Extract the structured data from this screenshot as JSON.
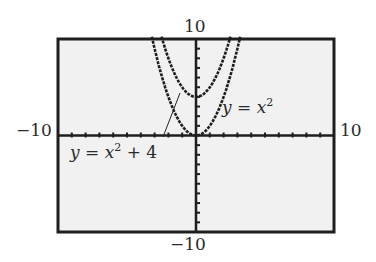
{
  "chart_data": {
    "type": "line",
    "title": "",
    "xlabel": "",
    "ylabel": "",
    "xlim": [
      -10,
      10
    ],
    "ylim": [
      -10,
      10
    ],
    "xscale": 1,
    "yscale": 1,
    "grid": false,
    "window_labels": {
      "ymax": "10",
      "xmin": "−10",
      "xmax": "10",
      "ymin": "−10"
    },
    "series": [
      {
        "name": "y = x^2",
        "equation": "x^2",
        "vertex": [
          0,
          0
        ]
      },
      {
        "name": "y = x^2 + 4",
        "equation": "x^2 + 4",
        "vertex": [
          0,
          4
        ]
      }
    ],
    "annotations": [
      {
        "text_var": "y",
        "eq": " = ",
        "text_x": "x",
        "power": "2",
        "tail": "",
        "target": "y = x^2"
      },
      {
        "text_var": "y",
        "eq": " = ",
        "text_x": "x",
        "power": "2",
        "tail": " + 4",
        "target": "y = x^2 + 4"
      }
    ]
  }
}
